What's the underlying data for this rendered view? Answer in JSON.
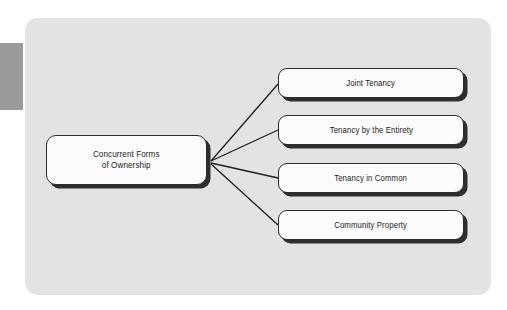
{
  "diagram": {
    "title": "Concurrent Forms of Ownership",
    "type": "fan-out-hierarchy",
    "background_color": "#ffffff",
    "panel_color": "#e3e3e3",
    "node_fill_color": "#fbfbfb",
    "node_border_color": "#2b2b2b",
    "node_shadow_color": "#2e2e2e",
    "connector_color": "#1f1f1f",
    "side_tab_color": "#9a9a9a",
    "root": {
      "label_line1": "Concurrent Forms",
      "label_line2": "of Ownership"
    },
    "branches": [
      {
        "label": "Joint Tenancy"
      },
      {
        "label": "Tenancy by the Entirety"
      },
      {
        "label": "Tenancy in Common"
      },
      {
        "label": "Community Property"
      }
    ]
  }
}
